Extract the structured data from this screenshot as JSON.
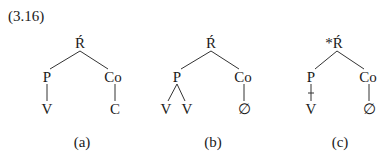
{
  "example_number": "(3.16)",
  "trees": [
    {
      "caption": "(a)",
      "root": "Ŕ",
      "left": "P",
      "right": "Co",
      "left_children": [
        "V"
      ],
      "right_children": [
        "C"
      ],
      "crossed_link": false
    },
    {
      "caption": "(b)",
      "root": "Ŕ",
      "left": "P",
      "right": "Co",
      "left_children": [
        "V",
        "V"
      ],
      "right_children": [
        "∅"
      ],
      "crossed_link": false
    },
    {
      "caption": "(c)",
      "root": "*Ŕ",
      "left": "P",
      "right": "Co",
      "left_children": [
        "V"
      ],
      "right_children": [
        "∅"
      ],
      "crossed_link": true
    }
  ]
}
